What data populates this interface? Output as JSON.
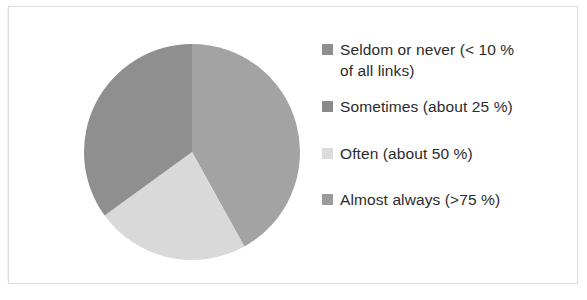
{
  "figure": {
    "background_color": "#ffffff",
    "frame_color": "#dcdcdc"
  },
  "chart_data": {
    "type": "pie",
    "title": "",
    "subtitle": "",
    "xlabel": "",
    "ylabel": "",
    "legend_position": "right",
    "grid": false,
    "start_angle_deg": 0,
    "direction": "clockwise",
    "categories": [
      "Seldom or never (< 10 % of all links)",
      "Sometimes (about 25 %)",
      "Often (about 50 %)",
      "Almost always (>75 %)"
    ],
    "values": [
      42,
      0,
      23,
      35
    ],
    "slice_colors": [
      "#a3a3a3",
      "#8f8f8f",
      "#d9d9d9",
      "#8f8f8f"
    ],
    "slices": [
      {
        "label": "Seldom or never (< 10 % of all links)",
        "value": 42,
        "start_deg": 0,
        "end_deg": 151,
        "color": "#a3a3a3"
      },
      {
        "label": "Often (about 50 %)",
        "value": 23,
        "start_deg": 151,
        "end_deg": 234,
        "color": "#d9d9d9"
      },
      {
        "label": "Almost always (>75 %)",
        "value": 35,
        "start_deg": 234,
        "end_deg": 360,
        "color": "#8f8f8f"
      }
    ],
    "center": {
      "x": 110,
      "y": 110
    },
    "radius": 108
  },
  "legend": {
    "items": [
      {
        "label": "Seldom or never (< 10 %\nof all links)",
        "color": "#8e8e8e",
        "swatch_name": "legend-swatch-seldom"
      },
      {
        "label": "Sometimes (about 25 %)",
        "color": "#8a8a8a",
        "swatch_name": "legend-swatch-sometimes"
      },
      {
        "label": "Often (about 50 %)",
        "color": "#dcdcdc",
        "swatch_name": "legend-swatch-often"
      },
      {
        "label": "Almost always (>75 %)",
        "color": "#9a9a9a",
        "swatch_name": "legend-swatch-almost-always"
      }
    ]
  }
}
